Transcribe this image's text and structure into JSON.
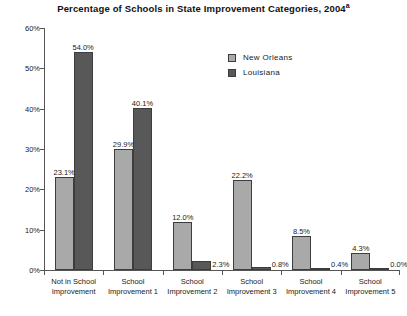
{
  "chart_data": {
    "type": "bar",
    "title": "Percentage of Schools in State Improvement Categories, 2004",
    "title_superscript": "a",
    "xlabel": "",
    "ylabel": "",
    "ylim": [
      0,
      60
    ],
    "ytick_labels": [
      "0%",
      "10%",
      "20%",
      "30%",
      "40%",
      "50%",
      "60%"
    ],
    "ytick_values": [
      0,
      10,
      20,
      30,
      40,
      50,
      60
    ],
    "grid": false,
    "legend_position": "upper-center-right",
    "categories": [
      "Not in School Improvement",
      "School Improvement 1",
      "School Improvement 2",
      "School Improvement 3",
      "School Improvement 4",
      "School Improvement 5"
    ],
    "category_lines": [
      [
        "Not in School",
        "Improvement"
      ],
      [
        "School",
        "Improvement 1"
      ],
      [
        "School",
        "Improvement 2"
      ],
      [
        "School",
        "Improvement 3"
      ],
      [
        "School",
        "Improvement 4"
      ],
      [
        "School",
        "Improvement 5"
      ]
    ],
    "series": [
      {
        "name": "New Orleans",
        "color": "#a9a9a9",
        "values": [
          23.1,
          29.9,
          12.0,
          22.2,
          8.5,
          4.3
        ],
        "labels": [
          "23.1%",
          "29.9%",
          "12.0%",
          "22.2%",
          "8.5%",
          "4.3%"
        ]
      },
      {
        "name": "Louisiana",
        "color": "#585858",
        "values": [
          54.0,
          40.1,
          2.3,
          0.8,
          0.4,
          0.0
        ],
        "labels": [
          "54.0%",
          "40.1%",
          "2.3%",
          "0.8%",
          "0.4%",
          "0.0%"
        ],
        "label_placement": [
          "top",
          "top",
          "side",
          "side",
          "side",
          "side"
        ]
      }
    ]
  }
}
